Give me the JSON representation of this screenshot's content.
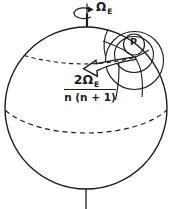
{
  "canvas": {
    "background": "#ffffff",
    "ink": "#1c1c1c"
  },
  "labels": {
    "rotation_symbol": "Ω",
    "rotation_subscript": "E",
    "point": "P",
    "numerator_main": "2Ω",
    "numerator_subscript": "E",
    "denominator": "n (n + 1)"
  }
}
